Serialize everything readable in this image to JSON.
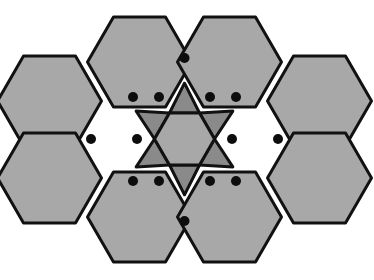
{
  "figure": {
    "canvas": {
      "width": 374,
      "height": 280,
      "background": "#ffffff"
    },
    "palette": {
      "hexagon_fill": "#a8a8a8",
      "triangle_fill": "#8a8a8a",
      "center_hexagon_fill": "#a8a8a8",
      "outline": "#111111",
      "vertex_dot": "#0d0d0d",
      "background": "#ffffff"
    },
    "geometry": {
      "center": {
        "x": 184.5,
        "y": 139
      },
      "outer_hex_circumradius": 52,
      "inner_hex_circumradius": 30,
      "outer_hex_orientation": "pointy-left-right",
      "vertex_dot_radius": 5,
      "stroke_width": 3
    },
    "counts": {
      "hexagons": 7,
      "triangles": 6,
      "vertex_dots": 12,
      "total_faces": 13
    },
    "hexagons": [
      {
        "name": "hexagon-center",
        "cx": 184.5,
        "cy": 139,
        "r": 30,
        "fill": "#a8a8a8"
      },
      {
        "name": "hexagon-top-left",
        "cx": 139.5,
        "cy": 62,
        "r": 52,
        "fill": "#a8a8a8"
      },
      {
        "name": "hexagon-top-right",
        "cx": 229.5,
        "cy": 62,
        "r": 52,
        "fill": "#a8a8a8"
      },
      {
        "name": "hexagon-mid-left",
        "cx": 49.5,
        "cy": 101,
        "r": 52,
        "fill": "#a8a8a8"
      },
      {
        "name": "hexagon-mid-right",
        "cx": 319.5,
        "cy": 101,
        "r": 52,
        "fill": "#a8a8a8"
      },
      {
        "name": "hexagon-lower-left",
        "cx": 49.5,
        "cy": 178,
        "r": 52,
        "fill": "#a8a8a8"
      },
      {
        "name": "hexagon-lower-right",
        "cx": 319.5,
        "cy": 178,
        "r": 52,
        "fill": "#a8a8a8"
      },
      {
        "name": "hexagon-bottom-left",
        "cx": 139.5,
        "cy": 217,
        "r": 52,
        "fill": "#a8a8a8"
      },
      {
        "name": "hexagon-bottom-right",
        "cx": 229.5,
        "cy": 217,
        "r": 52,
        "fill": "#a8a8a8"
      }
    ],
    "triangles": [
      {
        "name": "triangle-top",
        "fill": "#8a8a8a"
      },
      {
        "name": "triangle-upper-left",
        "fill": "#8a8a8a"
      },
      {
        "name": "triangle-upper-right",
        "fill": "#8a8a8a"
      },
      {
        "name": "triangle-lower-left",
        "fill": "#8a8a8a"
      },
      {
        "name": "triangle-lower-right",
        "fill": "#8a8a8a"
      },
      {
        "name": "triangle-bottom",
        "fill": "#8a8a8a"
      }
    ],
    "vertex_dots": [
      {
        "name": "vertex-top",
        "x": 184.5,
        "y": 58
      },
      {
        "name": "vertex-upper-inner-left",
        "x": 159,
        "y": 97
      },
      {
        "name": "vertex-upper-inner-right",
        "x": 210,
        "y": 97
      },
      {
        "name": "vertex-upper-outer-left",
        "x": 133,
        "y": 97
      },
      {
        "name": "vertex-upper-outer-right",
        "x": 236,
        "y": 97
      },
      {
        "name": "vertex-mid-far-left",
        "x": 91,
        "y": 139
      },
      {
        "name": "vertex-mid-inner-left",
        "x": 137,
        "y": 139
      },
      {
        "name": "vertex-mid-inner-right",
        "x": 232,
        "y": 139
      },
      {
        "name": "vertex-mid-far-right",
        "x": 278,
        "y": 139
      },
      {
        "name": "vertex-lower-outer-left",
        "x": 133,
        "y": 181
      },
      {
        "name": "vertex-lower-inner-left",
        "x": 159,
        "y": 181
      },
      {
        "name": "vertex-lower-inner-right",
        "x": 210,
        "y": 181
      },
      {
        "name": "vertex-lower-outer-right",
        "x": 236,
        "y": 181
      },
      {
        "name": "vertex-bottom",
        "x": 184.5,
        "y": 221
      }
    ]
  }
}
